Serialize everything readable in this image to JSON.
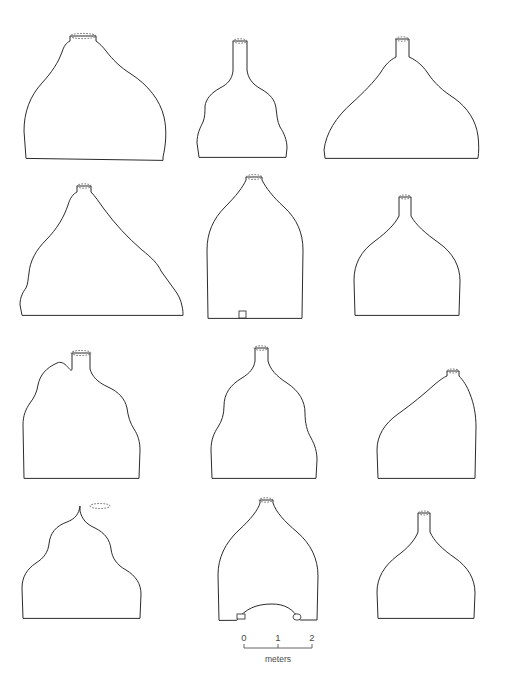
{
  "figure": {
    "type": "archaeological-profile-plate",
    "background_color": "#ffffff",
    "outline_color": "#2b2b2b",
    "rim_color": "#6d6d6d",
    "width": 523,
    "height": 690,
    "rows": 4,
    "columns": 3,
    "shape_count": 12
  },
  "scale_bar": {
    "name": "scale-bar",
    "unit_label": "meters",
    "ticks": [
      "0",
      "1",
      "2"
    ],
    "tick_values": [
      0,
      1,
      2
    ],
    "x_start": 244,
    "x_end": 312,
    "baseline_y": 648,
    "label_y": 641,
    "unit_y": 662
  },
  "shapes": [
    {
      "id": "shape-r1c1",
      "row": 1,
      "column": 1,
      "has_dashed_rim": true,
      "has_basal_aperture": false,
      "description": "asymmetric dome with offset neck and rounded right shoulder",
      "path": "M 26 158 L 24 131 C 24 112 30 96 42 83 C 52 72 58 63 62 52 C 64 46 66 43 70 41 L 70 36 L 96 36 L 96 41 C 100 44 103 47 106 51 C 113 60 120 67 131 74 C 148 85 160 100 164 117 C 167 130 166 144 163 157 L 163 160 Z",
      "rim": {
        "cx": 83,
        "cy": 36,
        "rx": 13,
        "ry": 2.6
      }
    },
    {
      "id": "shape-r1c2",
      "row": 1,
      "column": 2,
      "has_dashed_rim": true,
      "has_basal_aperture": false,
      "description": "tall narrow neck flaring to a broad skirted base",
      "path": "M 199 157 L 197 143 C 197 134 200 128 203 122 C 205 117 205 112 205 106 C 206 99 211 93 220 88 C 228 84 232 79 233 71 L 233 41 L 247 41 L 247 70 C 248 78 252 84 261 89 C 270 94 275 100 276 108 C 277 115 277 121 280 127 C 284 133 287 140 287 148 L 286 157 Z",
      "rim": {
        "cx": 240,
        "cy": 41,
        "rx": 7,
        "ry": 2.2
      }
    },
    {
      "id": "shape-r1c3",
      "row": 1,
      "column": 3,
      "has_dashed_rim": true,
      "has_basal_aperture": false,
      "description": "broad low dome with short central neck and splayed shoulders",
      "path": "M 325 158 L 324 150 C 326 133 336 117 352 103 C 363 93 374 82 381 72 C 385 65 390 60 396 57 L 396 39 L 409 39 L 409 57 C 416 60 422 65 427 72 C 434 83 443 91 454 98 C 468 108 476 121 478 136 C 479 144 479 152 478 158 Z",
      "rim": {
        "cx": 402,
        "cy": 39,
        "rx": 6.5,
        "ry": 2.2
      }
    },
    {
      "id": "shape-r2c1",
      "row": 2,
      "column": 1,
      "has_dashed_rim": true,
      "has_basal_aperture": false,
      "description": "asymmetric mound with stepped irregular right slope",
      "path": "M 22 315 L 20 305 C 20 297 23 292 26 288 C 28 284 28 279 29 273 C 30 261 36 250 46 240 C 57 229 64 217 68 205 C 70 198 73 194 77 192 L 77 186 L 91 186 L 91 192 C 95 196 99 202 104 209 C 115 224 128 238 142 250 C 152 258 158 264 161 271 C 165 277 170 283 174 289 C 178 294 181 300 182 306 C 183 310 183 313 183 315 Z",
      "rim": {
        "cx": 84,
        "cy": 186,
        "rx": 7,
        "ry": 2.2
      }
    },
    {
      "id": "shape-r2c2",
      "row": 2,
      "column": 2,
      "has_dashed_rim": true,
      "has_basal_aperture": true,
      "description": "wide rounded vault with short neck and small basal doorway",
      "path": "M 208 318 L 207 250 C 207 233 213 219 225 207 C 236 196 243 187 246 180 L 246 177 L 262 177 L 262 180 C 266 188 273 197 284 207 C 297 219 303 233 303 250 L 302 318 Z",
      "rim": {
        "cx": 254,
        "cy": 177,
        "rx": 8,
        "ry": 2.4
      },
      "aperture": {
        "x": 239,
        "y": 311,
        "width": 7,
        "height": 7
      }
    },
    {
      "id": "shape-r2c3",
      "row": 2,
      "column": 3,
      "has_dashed_rim": true,
      "has_basal_aperture": false,
      "description": "low smooth dome with slender centered neck",
      "path": "M 355 315 L 354 280 C 354 264 361 251 375 241 C 387 232 395 224 399 216 L 399 197 L 411 197 L 411 216 C 416 225 425 233 439 243 C 453 253 460 266 460 281 L 459 315 Z",
      "rim": {
        "cx": 405,
        "cy": 197,
        "rx": 6,
        "ry": 2.0
      }
    },
    {
      "id": "shape-r3c1",
      "row": 3,
      "column": 1,
      "has_dashed_rim": true,
      "has_basal_aperture": false,
      "description": "shouldered bell with slightly waisted sides and flat base",
      "path": "M 24 478 L 23 425 C 23 415 26 409 30 403 C 34 398 37 392 38 385 C 40 375 46 368 57 363 C 66 359 71 375 72 369 L 72 353 L 90 353 L 90 369 C 92 376 97 382 108 387 C 119 392 125 399 127 408 C 128 416 130 423 134 429 C 138 435 140 442 140 450 L 139 478 Z",
      "rim": {
        "cx": 81,
        "cy": 353,
        "rx": 10,
        "ry": 2.5
      }
    },
    {
      "id": "shape-r3c2",
      "row": 3,
      "column": 2,
      "has_dashed_rim": true,
      "has_basal_aperture": false,
      "description": "bulbous gourd-like profile with constricted waist",
      "path": "M 212 478 L 211 450 C 211 440 214 433 218 427 C 222 421 224 414 224 406 C 224 394 230 385 242 378 C 250 373 254 368 255 361 L 255 348 L 268 348 L 268 361 C 270 369 276 376 287 383 C 299 391 305 401 305 413 C 305 423 307 431 311 438 C 315 445 317 452 317 460 L 316 478 Z",
      "rim": {
        "cx": 261,
        "cy": 348,
        "rx": 7,
        "ry": 2.2
      }
    },
    {
      "id": "shape-r3c3",
      "row": 3,
      "column": 3,
      "has_dashed_rim": true,
      "has_basal_aperture": false,
      "description": "asymmetric low dome with neck offset to the right",
      "path": "M 378 478 L 377 450 C 377 436 384 424 398 414 C 412 404 424 394 434 385 C 440 380 444 377 447 376 L 447 371 L 459 371 L 459 376 C 463 380 467 386 470 394 C 474 404 476 415 476 427 L 475 478 Z",
      "rim": {
        "cx": 453,
        "cy": 371,
        "rx": 6,
        "ry": 2.0
      }
    },
    {
      "id": "shape-r4c1",
      "row": 4,
      "column": 1,
      "has_dashed_rim": true,
      "has_basal_aperture": false,
      "description": "double-lobed undulating profile with wide flat base",
      "path": "M 23 618 L 22 588 C 22 577 27 569 36 563 C 44 558 48 552 49 544 C 50 533 56 526 67 522 C 75 519 79 514 80 506 L 80 511 C 82 519 86 524 95 528 C 105 533 110 540 111 549 C 112 558 117 565 126 570 C 136 576 141 584 141 594 L 140 618 Z",
      "rim": {
        "cx": 100,
        "cy": 506,
        "rx": 10,
        "ry": 2.5
      }
    },
    {
      "id": "shape-r4c2",
      "row": 4,
      "column": 2,
      "has_dashed_rim": true,
      "has_basal_aperture": true,
      "description": "high conical vault over an arched basal opening with two small apertures",
      "path": "M 219 620 L 218 575 C 218 558 225 543 239 530 C 251 519 258 510 260 503 L 260 500 L 273 500 L 273 503 C 276 512 284 521 297 532 C 311 544 318 559 318 576 L 317 620 L 300 620 C 293 609 285 604 272 604 C 256 604 245 609 237 620 Z",
      "rim": {
        "cx": 266,
        "cy": 500,
        "rx": 7,
        "ry": 2.2
      },
      "aperture": {
        "x": 237,
        "y": 614,
        "width": 8,
        "height": 5
      },
      "aperture_secondary": {
        "cx": 297,
        "cy": 617,
        "rx": 4,
        "ry": 3.2
      }
    },
    {
      "id": "shape-r4c3",
      "row": 4,
      "column": 3,
      "has_dashed_rim": true,
      "has_basal_aperture": false,
      "description": "rounded dome with short straight neck and flat base",
      "path": "M 378 618 L 377 592 C 377 578 384 566 397 556 C 408 548 415 540 418 532 L 418 513 L 430 513 L 430 532 C 434 541 442 549 455 558 C 468 567 475 579 475 593 L 474 618 Z",
      "rim": {
        "cx": 424,
        "cy": 513,
        "rx": 6,
        "ry": 2.0
      }
    }
  ]
}
